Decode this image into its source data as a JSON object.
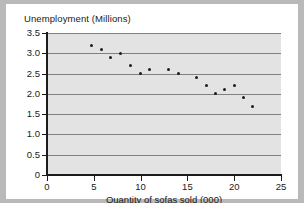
{
  "chart_data": {
    "type": "scatter",
    "title": "",
    "xlabel": "Quantity of sofas sold (000)",
    "ylabel": "Unemployment (Millions)",
    "xlim": [
      0,
      25
    ],
    "ylim": [
      0,
      3.5
    ],
    "xticks": [
      "0",
      "5",
      "10",
      "15",
      "20",
      "25"
    ],
    "xtick_values": [
      0,
      5,
      10,
      15,
      20,
      25
    ],
    "yticks": [
      "0",
      "0.5",
      "1.0",
      "1.5",
      "2.0",
      "2.5",
      "3.0",
      "3.5"
    ],
    "ytick_values": [
      0,
      0.5,
      1.0,
      1.5,
      2.0,
      2.5,
      3.0,
      3.5
    ],
    "grid": "horizontal",
    "legend": "none",
    "marker_color": "#1c1c1c",
    "plot_background": "#e3e3e3",
    "gridline_color": "#808080",
    "points": [
      {
        "x": 4.8,
        "y": 3.2
      },
      {
        "x": 5.8,
        "y": 3.1
      },
      {
        "x": 6.8,
        "y": 2.9
      },
      {
        "x": 7.9,
        "y": 3.0
      },
      {
        "x": 8.9,
        "y": 2.7
      },
      {
        "x": 10.0,
        "y": 2.5
      },
      {
        "x": 11.0,
        "y": 2.6
      },
      {
        "x": 13.0,
        "y": 2.6
      },
      {
        "x": 14.0,
        "y": 2.5
      },
      {
        "x": 16.0,
        "y": 2.4
      },
      {
        "x": 17.0,
        "y": 2.2
      },
      {
        "x": 18.0,
        "y": 2.0
      },
      {
        "x": 19.0,
        "y": 2.1
      },
      {
        "x": 20.0,
        "y": 2.2
      },
      {
        "x": 21.0,
        "y": 1.9
      },
      {
        "x": 22.0,
        "y": 1.7
      }
    ]
  }
}
